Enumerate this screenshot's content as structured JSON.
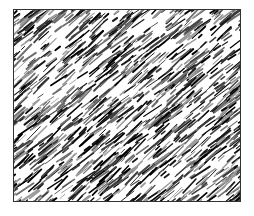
{
  "image": {
    "description": "Black-and-white diagonal streak noise texture inside a thin dark rectangular frame",
    "background_color": "#ffffff",
    "frame": {
      "x": 13,
      "y": 9,
      "width": 228,
      "height": 193,
      "border_color": "#333333"
    },
    "texture": {
      "style": "diagonal-streaks",
      "direction": "bottom-left to top-right",
      "angle_deg": -40,
      "stroke_colors": [
        "#000000",
        "#1a1a1a",
        "#404040",
        "#6e6e6e",
        "#9a9a9a"
      ],
      "base_fill": "#ffffff",
      "streak_count": 1400,
      "min_length": 4,
      "max_length": 22,
      "min_width": 0.8,
      "max_width": 2.2,
      "seed": 1337
    }
  }
}
